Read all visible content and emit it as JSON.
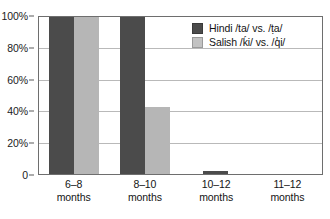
{
  "chart_data": {
    "type": "bar",
    "title": "",
    "subtitle": "",
    "xlabel": "",
    "ylabel": "",
    "categories": [
      "6–8 months",
      "8–10 months",
      "10–12 months",
      "11–12 months"
    ],
    "category_lines": [
      [
        "6–8",
        "months"
      ],
      [
        "8–10",
        "months"
      ],
      [
        "10–12",
        "months"
      ],
      [
        "11–12",
        "months"
      ]
    ],
    "series": [
      {
        "name": "Hindi /ta/ vs. /ṭa/",
        "color": "#4b4b4b",
        "values": [
          100,
          100,
          2,
          0
        ]
      },
      {
        "name": "Salish /ḱi/ vs. /q̓i/",
        "color": "#b6b6b6",
        "values": [
          100,
          43,
          0,
          0
        ]
      }
    ],
    "ylim": [
      0,
      100
    ],
    "yticks": [
      0,
      20,
      40,
      60,
      80,
      100
    ],
    "ytick_labels": [
      "0",
      "20%",
      "40%",
      "60%",
      "80%",
      "100%"
    ],
    "grid": true,
    "grid_axis": "y",
    "legend_position": "top-right",
    "value_unit": "%"
  },
  "legend": {
    "entries": [
      {
        "label": "Hindi /ta/ vs. /ṭa/"
      },
      {
        "label": "Salish /ḱi/ vs. /q̓i/"
      }
    ]
  }
}
